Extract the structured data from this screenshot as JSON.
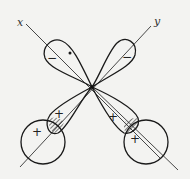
{
  "diagram": {
    "title": "",
    "axes": [
      {
        "label": "x"
      },
      {
        "label": "y"
      }
    ],
    "lobes": [
      {
        "position": "upper-left",
        "sign": "−"
      },
      {
        "position": "upper-right",
        "sign": "−"
      },
      {
        "position": "lower-left",
        "sign": "+"
      },
      {
        "position": "lower-right",
        "sign": "+"
      }
    ],
    "orbitals": [
      {
        "position": "lower-left",
        "sign": "+"
      },
      {
        "position": "lower-right",
        "sign": "+"
      }
    ],
    "colors": {
      "line": "#1a1a1a",
      "background": "#f3f3f1"
    }
  }
}
